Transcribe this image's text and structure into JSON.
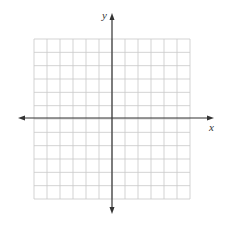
{
  "diagram": {
    "type": "coordinate-plane",
    "grid": {
      "columns": 12,
      "rows": 12,
      "left": 34,
      "top": 39,
      "right": 190,
      "bottom": 199,
      "line_color": "#c8c8c8"
    },
    "axes": {
      "color": "#333333",
      "x_axis": {
        "label": "x",
        "y": 118,
        "from": 18,
        "to": 214
      },
      "y_axis": {
        "label": "y",
        "x": 112,
        "from": 13,
        "to": 214
      }
    }
  }
}
